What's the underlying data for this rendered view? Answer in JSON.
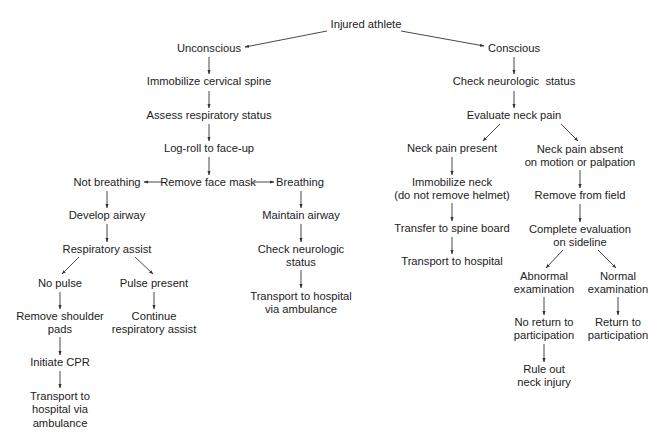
{
  "diagram": {
    "type": "flowchart",
    "title": "Injured athlete",
    "line_color": "#333333",
    "text_color": "#222222",
    "nodes": [
      {
        "id": "injured",
        "lines": [
          "Injured athlete"
        ],
        "x": 366,
        "y": 25
      },
      {
        "id": "unconscious",
        "lines": [
          "Unconscious"
        ],
        "x": 209,
        "y": 49
      },
      {
        "id": "conscious",
        "lines": [
          "Conscious"
        ],
        "x": 514,
        "y": 49
      },
      {
        "id": "immobilize_spine",
        "lines": [
          "Immobilize cervical spine"
        ],
        "x": 209,
        "y": 82
      },
      {
        "id": "assess_resp",
        "lines": [
          "Assess respiratory status"
        ],
        "x": 209,
        "y": 116
      },
      {
        "id": "log_roll",
        "lines": [
          "Log-roll to face-up"
        ],
        "x": 209,
        "y": 149
      },
      {
        "id": "remove_mask",
        "lines": [
          "Remove face mask"
        ],
        "x": 208,
        "y": 183
      },
      {
        "id": "not_breathing",
        "lines": [
          "Not breathing"
        ],
        "x": 107,
        "y": 183
      },
      {
        "id": "breathing",
        "lines": [
          "Breathing"
        ],
        "x": 300,
        "y": 183
      },
      {
        "id": "develop_airway",
        "lines": [
          "Develop airway"
        ],
        "x": 107,
        "y": 216
      },
      {
        "id": "maintain_airway",
        "lines": [
          "Maintain airway"
        ],
        "x": 301,
        "y": 216
      },
      {
        "id": "resp_assist",
        "lines": [
          "Respiratory assist"
        ],
        "x": 107,
        "y": 250
      },
      {
        "id": "check_neuro_left",
        "lines": [
          "Check neurologic",
          "status"
        ],
        "x": 301,
        "y": 256
      },
      {
        "id": "no_pulse",
        "lines": [
          "No pulse"
        ],
        "x": 60,
        "y": 284
      },
      {
        "id": "pulse_present",
        "lines": [
          "Pulse present"
        ],
        "x": 154,
        "y": 284
      },
      {
        "id": "transport_amb_right",
        "lines": [
          "Transport to hospital",
          "via ambulance"
        ],
        "x": 301,
        "y": 303
      },
      {
        "id": "remove_pads",
        "lines": [
          "Remove shoulder",
          "pads"
        ],
        "x": 60,
        "y": 323
      },
      {
        "id": "continue_resp",
        "lines": [
          "Continue",
          "respiratory assist"
        ],
        "x": 154,
        "y": 323
      },
      {
        "id": "initiate_cpr",
        "lines": [
          "Initiate CPR"
        ],
        "x": 60,
        "y": 363
      },
      {
        "id": "transport_amb_left",
        "lines": [
          "Transport to",
          "hospital via",
          "ambulance"
        ],
        "x": 60,
        "y": 410
      },
      {
        "id": "check_neuro_right",
        "lines": [
          "Check neurologic  status"
        ],
        "x": 514,
        "y": 82
      },
      {
        "id": "eval_neck",
        "lines": [
          "Evaluate neck pain"
        ],
        "x": 514,
        "y": 116
      },
      {
        "id": "neck_pain_present",
        "lines": [
          "Neck pain present"
        ],
        "x": 452,
        "y": 149
      },
      {
        "id": "neck_pain_absent",
        "lines": [
          "Neck pain absent",
          "on motion or palpation"
        ],
        "x": 580,
        "y": 156
      },
      {
        "id": "immobilize_neck",
        "lines": [
          "Immobilize neck",
          "(do not remove helmet)"
        ],
        "x": 452,
        "y": 189
      },
      {
        "id": "remove_field",
        "lines": [
          "Remove from field"
        ],
        "x": 580,
        "y": 196
      },
      {
        "id": "spine_board",
        "lines": [
          "Transfer to spine board"
        ],
        "x": 452,
        "y": 229
      },
      {
        "id": "complete_eval",
        "lines": [
          "Complete evaluation",
          "on sideline"
        ],
        "x": 580,
        "y": 236
      },
      {
        "id": "transport_hosp",
        "lines": [
          "Transport to hospital"
        ],
        "x": 452,
        "y": 262
      },
      {
        "id": "abnormal_exam",
        "lines": [
          "Abnormal",
          "examination"
        ],
        "x": 544,
        "y": 283
      },
      {
        "id": "normal_exam",
        "lines": [
          "Normal",
          "examination"
        ],
        "x": 618,
        "y": 283
      },
      {
        "id": "no_return",
        "lines": [
          "No return to",
          "participation"
        ],
        "x": 544,
        "y": 329
      },
      {
        "id": "return_part",
        "lines": [
          "Return to",
          "participation"
        ],
        "x": 618,
        "y": 329
      },
      {
        "id": "rule_out",
        "lines": [
          "Rule out",
          "neck injury"
        ],
        "x": 544,
        "y": 376
      }
    ],
    "edges": [
      {
        "from": "injured",
        "to": "unconscious",
        "x1": 327,
        "y1": 31,
        "x2": 245,
        "y2": 47
      },
      {
        "from": "injured",
        "to": "conscious",
        "x1": 401,
        "y1": 31,
        "x2": 484,
        "y2": 46
      },
      {
        "from": "unconscious",
        "to": "immobilize_spine",
        "x1": 209,
        "y1": 57,
        "x2": 209,
        "y2": 74
      },
      {
        "from": "immobilize_spine",
        "to": "assess_resp",
        "x1": 209,
        "y1": 91,
        "x2": 209,
        "y2": 108
      },
      {
        "from": "assess_resp",
        "to": "log_roll",
        "x1": 209,
        "y1": 124,
        "x2": 209,
        "y2": 141
      },
      {
        "from": "log_roll",
        "to": "remove_mask",
        "x1": 209,
        "y1": 157,
        "x2": 209,
        "y2": 175
      },
      {
        "from": "remove_mask",
        "to": "not_breathing",
        "x1": 162,
        "y1": 182,
        "x2": 144,
        "y2": 182
      },
      {
        "from": "remove_mask",
        "to": "breathing",
        "x1": 254,
        "y1": 182,
        "x2": 274,
        "y2": 182
      },
      {
        "from": "not_breathing",
        "to": "develop_airway",
        "x1": 107,
        "y1": 191,
        "x2": 107,
        "y2": 208
      },
      {
        "from": "breathing",
        "to": "maintain_airway",
        "x1": 301,
        "y1": 191,
        "x2": 301,
        "y2": 208
      },
      {
        "from": "develop_airway",
        "to": "resp_assist",
        "x1": 107,
        "y1": 224,
        "x2": 107,
        "y2": 242
      },
      {
        "from": "maintain_airway",
        "to": "check_neuro_left",
        "x1": 301,
        "y1": 224,
        "x2": 301,
        "y2": 242
      },
      {
        "from": "resp_assist",
        "to": "no_pulse",
        "x1": 79,
        "y1": 257,
        "x2": 62,
        "y2": 274
      },
      {
        "from": "resp_assist",
        "to": "pulse_present",
        "x1": 135,
        "y1": 257,
        "x2": 153,
        "y2": 274
      },
      {
        "from": "check_neuro_left",
        "to": "transport_amb_right",
        "x1": 301,
        "y1": 270,
        "x2": 301,
        "y2": 288
      },
      {
        "from": "no_pulse",
        "to": "remove_pads",
        "x1": 60,
        "y1": 292,
        "x2": 60,
        "y2": 309
      },
      {
        "from": "pulse_present",
        "to": "continue_resp",
        "x1": 154,
        "y1": 292,
        "x2": 154,
        "y2": 309
      },
      {
        "from": "remove_pads",
        "to": "initiate_cpr",
        "x1": 60,
        "y1": 337,
        "x2": 60,
        "y2": 355
      },
      {
        "from": "initiate_cpr",
        "to": "transport_amb_left",
        "x1": 60,
        "y1": 371,
        "x2": 60,
        "y2": 388
      },
      {
        "from": "conscious",
        "to": "check_neuro_right",
        "x1": 514,
        "y1": 57,
        "x2": 514,
        "y2": 74
      },
      {
        "from": "check_neuro_right",
        "to": "eval_neck",
        "x1": 514,
        "y1": 91,
        "x2": 514,
        "y2": 108
      },
      {
        "from": "eval_neck",
        "to": "neck_pain_present",
        "x1": 500,
        "y1": 124,
        "x2": 483,
        "y2": 141
      },
      {
        "from": "eval_neck",
        "to": "neck_pain_absent",
        "x1": 561,
        "y1": 124,
        "x2": 578,
        "y2": 141
      },
      {
        "from": "neck_pain_present",
        "to": "immobilize_neck",
        "x1": 452,
        "y1": 157,
        "x2": 452,
        "y2": 175
      },
      {
        "from": "neck_pain_absent",
        "to": "remove_field",
        "x1": 580,
        "y1": 170,
        "x2": 580,
        "y2": 188
      },
      {
        "from": "immobilize_neck",
        "to": "spine_board",
        "x1": 452,
        "y1": 203,
        "x2": 452,
        "y2": 221
      },
      {
        "from": "remove_field",
        "to": "complete_eval",
        "x1": 580,
        "y1": 204,
        "x2": 580,
        "y2": 222
      },
      {
        "from": "spine_board",
        "to": "transport_hosp",
        "x1": 452,
        "y1": 237,
        "x2": 452,
        "y2": 254
      },
      {
        "from": "complete_eval",
        "to": "abnormal_exam",
        "x1": 563,
        "y1": 250,
        "x2": 546,
        "y2": 268
      },
      {
        "from": "complete_eval",
        "to": "normal_exam",
        "x1": 598,
        "y1": 250,
        "x2": 616,
        "y2": 268
      },
      {
        "from": "abnormal_exam",
        "to": "no_return",
        "x1": 544,
        "y1": 297,
        "x2": 544,
        "y2": 315
      },
      {
        "from": "normal_exam",
        "to": "return_part",
        "x1": 618,
        "y1": 297,
        "x2": 618,
        "y2": 315
      },
      {
        "from": "no_return",
        "to": "rule_out",
        "x1": 544,
        "y1": 344,
        "x2": 544,
        "y2": 362
      }
    ]
  }
}
